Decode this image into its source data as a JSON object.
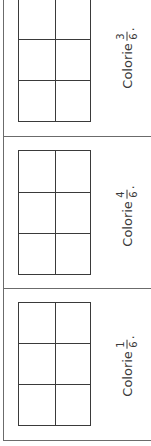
{
  "exercises": [
    {
      "label": "Colorie",
      "fraction": {
        "numerator": "3",
        "denominator": "6"
      },
      "punctuation": ".",
      "grid": {
        "rows": 3,
        "cols": 2
      }
    },
    {
      "label": "Colorie",
      "fraction": {
        "numerator": "4",
        "denominator": "6"
      },
      "punctuation": ".",
      "grid": {
        "rows": 3,
        "cols": 2
      }
    },
    {
      "label": "Colorie",
      "fraction": {
        "numerator": "1",
        "denominator": "6"
      },
      "punctuation": ".",
      "grid": {
        "rows": 3,
        "cols": 2
      }
    }
  ],
  "colors": {
    "line": "#3a3a3a",
    "frame": "#6b6b6b",
    "background": "#ffffff"
  }
}
